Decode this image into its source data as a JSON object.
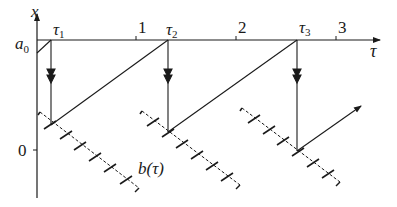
{
  "diagram": {
    "axes": {
      "vertical_label": "x",
      "horizontal_label": "τ",
      "a0_label": "a",
      "a0_subscript": "0",
      "zero_label": "0"
    },
    "tau_ticks": [
      {
        "label": "τ",
        "sub": "1",
        "x": 51
      },
      {
        "label": "1",
        "x": 136
      },
      {
        "label": "τ",
        "sub": "2",
        "x": 168
      },
      {
        "label": "2",
        "x": 236
      },
      {
        "label": "τ",
        "sub": "3",
        "x": 297
      },
      {
        "label": "3",
        "x": 336
      }
    ],
    "curve_label": "b(τ)",
    "colors": {
      "stroke": "#1a1a1a",
      "background": "#ffffff"
    }
  }
}
